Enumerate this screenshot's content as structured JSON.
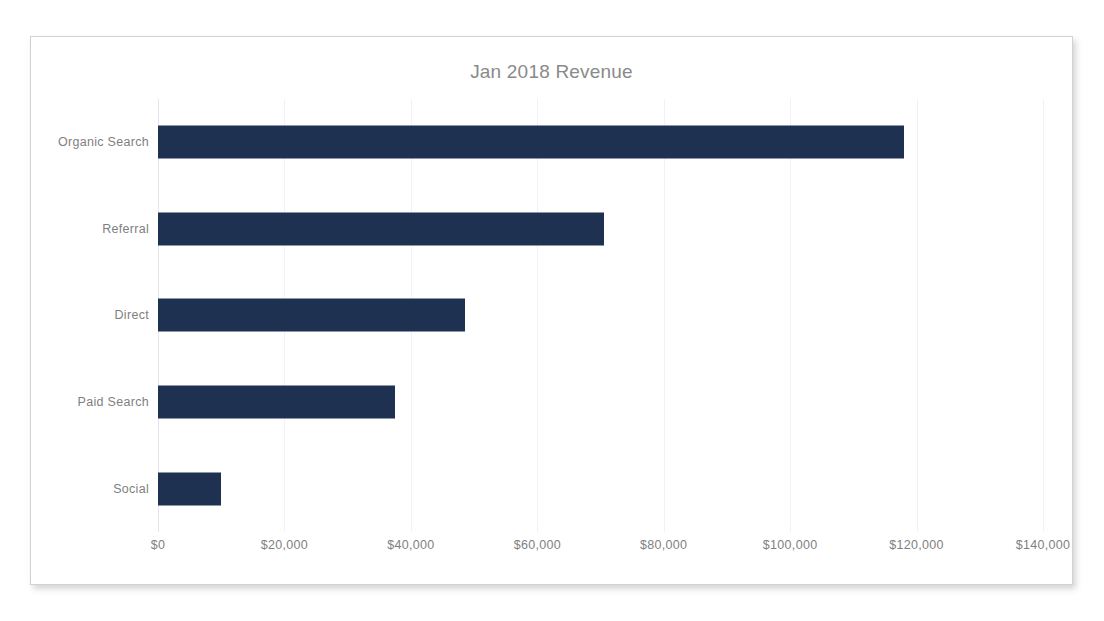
{
  "chart_data": {
    "type": "bar",
    "orientation": "horizontal",
    "title": "Jan 2018 Revenue",
    "xlabel": "",
    "ylabel": "",
    "categories": [
      "Organic Search",
      "Referral",
      "Direct",
      "Paid Search",
      "Social"
    ],
    "values": [
      118000,
      70500,
      48500,
      37500,
      10000
    ],
    "xlim": [
      0,
      140000
    ],
    "xticks": [
      0,
      20000,
      40000,
      60000,
      80000,
      100000,
      120000,
      140000
    ],
    "xtick_labels": [
      "$0",
      "$20,000",
      "$40,000",
      "$60,000",
      "$80,000",
      "$100,000",
      "$120,000",
      "$140,000"
    ],
    "grid": true,
    "gridline_axis": "x",
    "legend": false,
    "bar_color": "#1f3151",
    "title_color": "#8a8a8a",
    "label_color": "#7f7f7f",
    "gridline_color": "#f0f2f5"
  }
}
